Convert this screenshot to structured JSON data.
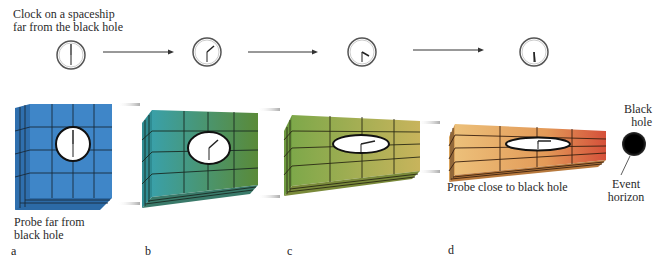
{
  "caption_top": {
    "line1": "Clock on a spaceship",
    "line2": "far from the black hole"
  },
  "panels": [
    {
      "letter": "a",
      "probe_label_line1": "Probe far from",
      "probe_label_line2": "black hole",
      "box_color": "#3f86c8",
      "clock_time": "12:00"
    },
    {
      "letter": "b",
      "box_color": "#3f8f86",
      "clock_time": "1:32"
    },
    {
      "letter": "c",
      "box_color": "#8f9a45",
      "clock_time": "2:28"
    },
    {
      "letter": "d",
      "probe_label": "Probe close to black hole",
      "box_color": "#e4a05a",
      "clock_time": "3:30"
    }
  ],
  "black_hole": {
    "label_line1": "Black",
    "label_line2": "hole",
    "event_horizon_line1": "Event",
    "event_horizon_line2": "horizon"
  },
  "colors": {
    "box_a": "#3f86c8",
    "box_b_left": "#3a9aa0",
    "box_b_right": "#5b8a3a",
    "box_c_left": "#7ea84a",
    "box_c_right": "#c9b25a",
    "box_d_left": "#e8b870",
    "box_d_right": "#d9583a",
    "black_hole": "#000000"
  }
}
